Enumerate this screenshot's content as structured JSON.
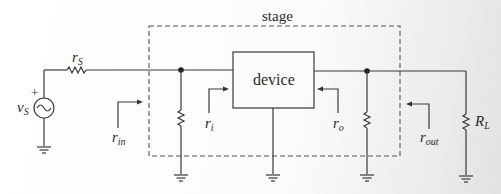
{
  "diagram": {
    "stage_label": "stage",
    "device_label": "device",
    "source": {
      "symbol": "v",
      "sub": "S",
      "polarity": "+"
    },
    "source_resistor": {
      "symbol": "r",
      "sub": "S"
    },
    "load_resistor": {
      "symbol": "R",
      "sub": "L"
    },
    "resistance_labels": {
      "r_in": {
        "symbol": "r",
        "sub": "in"
      },
      "r_i": {
        "symbol": "r",
        "sub": "i"
      },
      "r_o": {
        "symbol": "r",
        "sub": "o"
      },
      "r_out": {
        "symbol": "r",
        "sub": "out"
      }
    },
    "colors": {
      "wire": "#3a3a3a",
      "dashed_box": "#555555",
      "text": "#2a2a2a"
    }
  }
}
